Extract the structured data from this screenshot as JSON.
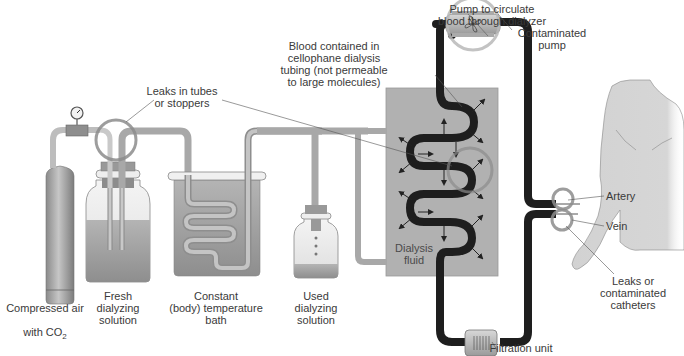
{
  "colors": {
    "tube_gray": "#a9a9a9",
    "tube_dark": "#1e1e1e",
    "dialyzer_fill": "#b0b0b0",
    "liquid_gray": "#9c9c9c",
    "highlight_ring": "#8c8c8c",
    "body_skin": "#d4d4d4",
    "text": "#3a3a3a"
  },
  "labels": {
    "pump_to_circulate": "Pump to circulate\nblood through dialyzer",
    "contaminated_pump": "Contaminated\npump",
    "blood_contained": "Blood contained in\ncellophane dialysis\ntubing (not permeable\nto large molecules)",
    "leaks_in_tubes": "Leaks in tubes\nor stoppers",
    "compressed_air_line1": "Compressed air",
    "compressed_air_line2_prefix": "with CO",
    "compressed_air_line2_sub": "2",
    "fresh_dialyzing": "Fresh\ndialyzing\nsolution",
    "constant_temp_bath": "Constant\n(body) temperature\nbath",
    "used_dialyzing": "Used\ndialyzing\nsolution",
    "dialysis_fluid": "Dialysis\nfluid",
    "artery": "Artery",
    "vein": "Vein",
    "leaks_catheters": "Leaks or\ncontaminated\ncatheters",
    "filtration_unit": "Filtration unit"
  }
}
